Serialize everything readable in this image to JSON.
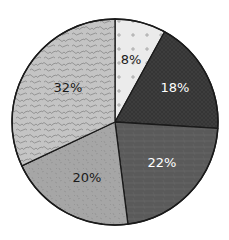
{
  "chart_data": {
    "type": "pie",
    "title": "",
    "start_angle_deg": 0,
    "direction": "clockwise",
    "center": [
      115,
      122
    ],
    "radius": 103,
    "slices": [
      {
        "label": "8%",
        "value": 8,
        "fill": "#ebebeb",
        "pattern": "plus-dots",
        "pattern_color": "#9a9a9a",
        "text_color": "#1a1a1a",
        "label_pos": [
          131,
          60
        ]
      },
      {
        "label": "18%",
        "value": 18,
        "fill": "#353535",
        "pattern": "crosshatch",
        "pattern_color": "#454545",
        "text_color": "#ffffff",
        "label_pos": [
          175,
          88
        ]
      },
      {
        "label": "22%",
        "value": 22,
        "fill": "#5a5a5a",
        "pattern": "scratches",
        "pattern_color": "#6a6a6a",
        "text_color": "#ffffff",
        "label_pos": [
          162,
          163
        ]
      },
      {
        "label": "20%",
        "value": 20,
        "fill": "#a6a6a6",
        "pattern": "speckle",
        "pattern_color": "#8c8c8c",
        "text_color": "#1a1a1a",
        "label_pos": [
          87,
          178
        ]
      },
      {
        "label": "32%",
        "value": 32,
        "fill": "#c4c4c4",
        "pattern": "squiggle",
        "pattern_color": "#8e8e8e",
        "text_color": "#1a1a1a",
        "label_pos": [
          68,
          88
        ]
      }
    ],
    "legend": null,
    "outline_color": "#1a1a1a"
  }
}
